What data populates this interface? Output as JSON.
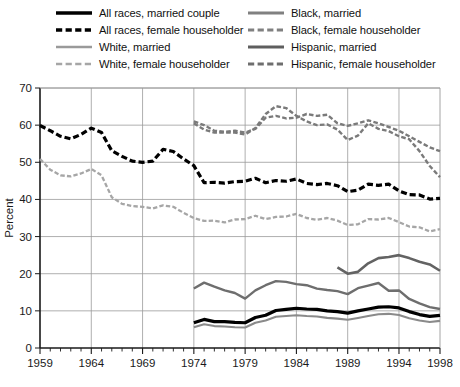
{
  "chart_data": {
    "type": "line",
    "title": "",
    "xlabel": "",
    "ylabel": "Percent",
    "xlim": [
      1959,
      1998
    ],
    "ylim": [
      0,
      70
    ],
    "ytick_values": [
      0,
      10,
      20,
      30,
      40,
      50,
      60,
      70
    ],
    "ytick_labels": [
      "0",
      "10",
      "20",
      "30",
      "40",
      "50",
      "60",
      "70"
    ],
    "xtick_values": [
      1959,
      1964,
      1969,
      1974,
      1979,
      1984,
      1989,
      1994,
      1998
    ],
    "xtick_labels": [
      "1959",
      "1964",
      "1969",
      "1974",
      "1979",
      "1984",
      "1989",
      "1994",
      "1998"
    ],
    "xminor_step": 1,
    "grid": "horizontal-and-vertical-at-major-ticks",
    "legend_position": "above-plot-two-columns",
    "series": [
      {
        "name": "All races, married couple",
        "style": "solid",
        "color": "#000000",
        "width": 3.2,
        "x": [
          1974,
          1975,
          1976,
          1977,
          1978,
          1979,
          1980,
          1981,
          1982,
          1983,
          1984,
          1985,
          1986,
          1987,
          1988,
          1989,
          1990,
          1991,
          1992,
          1993,
          1994,
          1995,
          1996,
          1997,
          1998
        ],
        "y": [
          6.8,
          7.7,
          7.1,
          7.1,
          6.9,
          6.8,
          8.2,
          8.8,
          10.1,
          10.4,
          10.7,
          10.5,
          10.4,
          10.0,
          9.8,
          9.4,
          10.0,
          10.5,
          11.0,
          11.1,
          10.8,
          9.8,
          9.0,
          8.5,
          8.8
        ]
      },
      {
        "name": "All races, female householder",
        "style": "dashed",
        "color": "#000000",
        "width": 3.2,
        "x": [
          1959,
          1960,
          1961,
          1962,
          1963,
          1964,
          1965,
          1966,
          1967,
          1968,
          1969,
          1970,
          1971,
          1972,
          1973,
          1974,
          1975,
          1976,
          1977,
          1978,
          1979,
          1980,
          1981,
          1982,
          1983,
          1984,
          1985,
          1986,
          1987,
          1988,
          1989,
          1990,
          1991,
          1992,
          1993,
          1994,
          1995,
          1996,
          1997,
          1998
        ],
        "y": [
          59.9,
          58.5,
          57.0,
          56.3,
          57.5,
          59.2,
          58.0,
          53.1,
          51.6,
          50.3,
          50.0,
          50.3,
          53.5,
          52.9,
          50.9,
          49.1,
          44.5,
          44.6,
          44.4,
          44.8,
          44.9,
          45.7,
          44.5,
          45.1,
          44.9,
          45.5,
          44.3,
          44.0,
          44.3,
          43.7,
          42.1,
          42.5,
          44.1,
          43.8,
          44.1,
          42.3,
          41.3,
          41.2,
          40.1,
          40.3
        ]
      },
      {
        "name": "White, married",
        "style": "solid",
        "color": "#8a8a8a",
        "width": 2.1,
        "x": [
          1974,
          1975,
          1976,
          1977,
          1978,
          1979,
          1980,
          1981,
          1982,
          1983,
          1984,
          1985,
          1986,
          1987,
          1988,
          1989,
          1990,
          1991,
          1992,
          1993,
          1994,
          1995,
          1996,
          1997,
          1998
        ],
        "y": [
          5.6,
          6.4,
          5.9,
          5.8,
          5.6,
          5.5,
          6.8,
          7.4,
          8.4,
          8.6,
          8.8,
          8.6,
          8.5,
          8.1,
          7.9,
          7.6,
          8.1,
          8.6,
          9.1,
          9.2,
          8.9,
          8.0,
          7.4,
          7.0,
          7.3
        ]
      },
      {
        "name": "White, female householder",
        "style": "dashed",
        "color": "#a6a6a6",
        "width": 2.3,
        "x": [
          1959,
          1960,
          1961,
          1962,
          1963,
          1964,
          1965,
          1966,
          1967,
          1968,
          1969,
          1970,
          1971,
          1972,
          1973,
          1974,
          1975,
          1976,
          1977,
          1978,
          1979,
          1980,
          1981,
          1982,
          1983,
          1984,
          1985,
          1986,
          1987,
          1988,
          1989,
          1990,
          1991,
          1992,
          1993,
          1994,
          1995,
          1996,
          1997,
          1998
        ],
        "y": [
          50.9,
          48.0,
          46.5,
          46.2,
          47.0,
          48.2,
          46.5,
          40.6,
          38.8,
          38.2,
          38.0,
          37.6,
          38.4,
          38.0,
          36.4,
          35.0,
          34.2,
          34.3,
          33.8,
          34.6,
          34.7,
          35.6,
          34.7,
          35.3,
          35.4,
          36.1,
          35.0,
          34.5,
          35.0,
          34.3,
          33.1,
          33.3,
          34.7,
          34.6,
          35.0,
          33.9,
          32.7,
          32.5,
          31.4,
          32.0
        ]
      },
      {
        "name": "Black, married",
        "style": "solid",
        "color": "#6e6e6e",
        "width": 2.4,
        "x": [
          1974,
          1975,
          1976,
          1977,
          1978,
          1979,
          1980,
          1981,
          1982,
          1983,
          1984,
          1985,
          1986,
          1987,
          1988,
          1989,
          1990,
          1991,
          1992,
          1993,
          1994,
          1995,
          1996,
          1997,
          1998
        ],
        "y": [
          16.0,
          17.6,
          16.5,
          15.5,
          14.8,
          13.3,
          15.5,
          16.9,
          18.0,
          17.8,
          17.2,
          16.9,
          16.0,
          15.6,
          15.3,
          14.5,
          16.1,
          16.8,
          17.5,
          15.4,
          15.5,
          13.2,
          12.0,
          11.0,
          10.5
        ]
      },
      {
        "name": "Black, female householder",
        "style": "dashed",
        "color": "#7a7a7a",
        "width": 2.4,
        "x": [
          1974,
          1975,
          1976,
          1977,
          1978,
          1979,
          1980,
          1981,
          1982,
          1983,
          1984,
          1985,
          1986,
          1987,
          1988,
          1989,
          1990,
          1991,
          1992,
          1993,
          1994,
          1995,
          1996,
          1997,
          1998
        ],
        "y": [
          60.5,
          58.8,
          58.0,
          58.0,
          58.0,
          57.5,
          59.2,
          63.0,
          65.1,
          64.6,
          62.5,
          61.0,
          60.0,
          60.2,
          58.8,
          56.0,
          57.2,
          60.5,
          59.0,
          58.4,
          57.0,
          56.2,
          53.0,
          49.0,
          46.0
        ]
      },
      {
        "name": "Hispanic, married",
        "style": "solid",
        "color": "#636363",
        "width": 2.6,
        "x": [
          1988,
          1989,
          1990,
          1991,
          1992,
          1993,
          1994,
          1995,
          1996,
          1997,
          1998
        ],
        "y": [
          21.7,
          20.0,
          20.5,
          22.8,
          24.2,
          24.5,
          25.0,
          24.2,
          23.2,
          22.5,
          20.8
        ]
      },
      {
        "name": "Hispanic, female householder",
        "style": "dashed",
        "color": "#7a7a7a",
        "width": 2.4,
        "x": [
          1974,
          1975,
          1976,
          1977,
          1978,
          1979,
          1980,
          1981,
          1982,
          1983,
          1984,
          1985,
          1986,
          1987,
          1988,
          1989,
          1990,
          1991,
          1992,
          1993,
          1994,
          1995,
          1996,
          1997,
          1998
        ],
        "y": [
          61.0,
          60.0,
          58.5,
          58.2,
          58.5,
          58.0,
          59.0,
          62.0,
          62.5,
          61.8,
          62.0,
          63.0,
          62.5,
          62.8,
          60.5,
          59.8,
          60.5,
          61.3,
          60.5,
          59.5,
          58.5,
          57.0,
          55.5,
          54.0,
          53.0
        ]
      }
    ]
  },
  "legend": {
    "columns": [
      {
        "items": [
          {
            "label": "All races, married couple",
            "style": "solid",
            "color": "#000000",
            "width": 3.4
          },
          {
            "label": "All races, female householder",
            "style": "dashed",
            "color": "#000000",
            "width": 3.4
          },
          {
            "label": "White, married",
            "style": "solid",
            "color": "#9a9a9a",
            "width": 2.6
          },
          {
            "label": "White, female householder",
            "style": "dashed",
            "color": "#a6a6a6",
            "width": 2.6
          }
        ]
      },
      {
        "items": [
          {
            "label": "Black, married",
            "style": "solid",
            "color": "#808080",
            "width": 2.8
          },
          {
            "label": "Black, female householder",
            "style": "dashed",
            "color": "#808080",
            "width": 2.8
          },
          {
            "label": "Hispanic, married",
            "style": "solid",
            "color": "#5e5e5e",
            "width": 3.0
          },
          {
            "label": "Hispanic, female householder",
            "style": "dashed",
            "color": "#6e6e6e",
            "width": 2.8
          }
        ]
      }
    ]
  },
  "colors": {
    "axis": "#1a1a1a",
    "grid": "#9a9a9a",
    "background": "#ffffff"
  }
}
